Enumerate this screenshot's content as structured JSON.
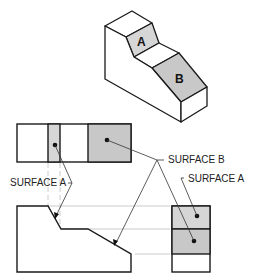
{
  "figure": {
    "isometric": {
      "surface_a_label": "A",
      "surface_b_label": "B"
    },
    "callouts": {
      "surface_b": "SURFACE B",
      "surface_a_right": "SURFACE A",
      "surface_a_left": "SURFACE A"
    },
    "colors": {
      "surface_a_fill": "#d6d6d6",
      "surface_b_fill": "#c8c8c8",
      "line": "#1a1a1a",
      "projection_line": "#bdbdbd"
    }
  }
}
